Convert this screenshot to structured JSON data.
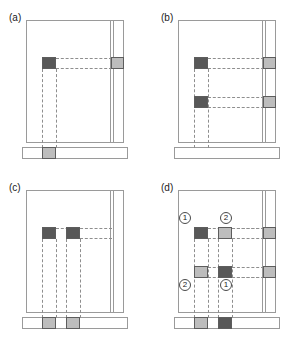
{
  "figure": {
    "colors": {
      "dark_block": "#585858",
      "light_block": "#bdbdbd",
      "outline": "#9a9a9a",
      "dashed_guide": "#8e8e8e",
      "background": "#ffffff"
    },
    "panels": [
      {
        "id": "a",
        "label": "(a)",
        "blocks": [
          {
            "name": "interior-block-1",
            "tone": "dark",
            "x": 42,
            "y": 57,
            "w": 14,
            "h": 12
          },
          {
            "name": "rail-block-1",
            "tone": "light",
            "x": 111,
            "y": 57,
            "w": 13,
            "h": 12
          },
          {
            "name": "bottom-bar-block-1",
            "tone": "light",
            "x": 42,
            "y": 147,
            "w": 14,
            "h": 12
          }
        ],
        "guides": {
          "horizontal": [
            {
              "x": 56,
              "y": 58,
              "w": 56
            },
            {
              "x": 56,
              "y": 68,
              "w": 56
            }
          ],
          "vertical": [
            {
              "x": 42,
              "y": 69,
              "h": 79
            },
            {
              "x": 56,
              "y": 69,
              "h": 79
            }
          ]
        },
        "markers": []
      },
      {
        "id": "b",
        "label": "(b)",
        "blocks": [
          {
            "name": "interior-block-1",
            "tone": "dark",
            "x": 42,
            "y": 57,
            "w": 14,
            "h": 12
          },
          {
            "name": "interior-block-2",
            "tone": "dark",
            "x": 42,
            "y": 96,
            "w": 14,
            "h": 12
          },
          {
            "name": "rail-block-1",
            "tone": "light",
            "x": 111,
            "y": 57,
            "w": 13,
            "h": 12
          },
          {
            "name": "rail-block-2",
            "tone": "light",
            "x": 111,
            "y": 96,
            "w": 13,
            "h": 12
          }
        ],
        "guides": {
          "horizontal": [
            {
              "x": 56,
              "y": 58,
              "w": 56
            },
            {
              "x": 56,
              "y": 68,
              "w": 56
            },
            {
              "x": 56,
              "y": 97,
              "w": 56
            },
            {
              "x": 56,
              "y": 107,
              "w": 56
            }
          ],
          "vertical": [
            {
              "x": 42,
              "y": 69,
              "h": 79
            },
            {
              "x": 56,
              "y": 69,
              "h": 79
            }
          ]
        },
        "markers": []
      },
      {
        "id": "c",
        "label": "(c)",
        "blocks": [
          {
            "name": "interior-block-1",
            "tone": "dark",
            "x": 42,
            "y": 57,
            "w": 14,
            "h": 12
          },
          {
            "name": "interior-block-2",
            "tone": "dark",
            "x": 66,
            "y": 57,
            "w": 14,
            "h": 12
          },
          {
            "name": "bottom-bar-block-1",
            "tone": "light",
            "x": 42,
            "y": 147,
            "w": 14,
            "h": 12
          },
          {
            "name": "bottom-bar-block-2",
            "tone": "light",
            "x": 66,
            "y": 147,
            "w": 14,
            "h": 12
          }
        ],
        "guides": {
          "horizontal": [
            {
              "x": 56,
              "y": 58,
              "w": 56
            },
            {
              "x": 80,
              "y": 68,
              "w": 32
            }
          ],
          "vertical": [
            {
              "x": 42,
              "y": 69,
              "h": 79
            },
            {
              "x": 56,
              "y": 69,
              "h": 79
            },
            {
              "x": 66,
              "y": 69,
              "h": 79
            },
            {
              "x": 80,
              "y": 69,
              "h": 79
            }
          ]
        },
        "markers": []
      },
      {
        "id": "d",
        "label": "(d)",
        "blocks": [
          {
            "name": "interior-block-1",
            "tone": "dark",
            "x": 42,
            "y": 57,
            "w": 14,
            "h": 12
          },
          {
            "name": "interior-block-2",
            "tone": "light",
            "x": 66,
            "y": 57,
            "w": 14,
            "h": 12
          },
          {
            "name": "interior-block-3",
            "tone": "light",
            "x": 42,
            "y": 96,
            "w": 14,
            "h": 12
          },
          {
            "name": "interior-block-4",
            "tone": "dark",
            "x": 66,
            "y": 96,
            "w": 14,
            "h": 12
          },
          {
            "name": "rail-block-1",
            "tone": "light",
            "x": 111,
            "y": 57,
            "w": 13,
            "h": 12
          },
          {
            "name": "rail-block-2",
            "tone": "light",
            "x": 111,
            "y": 96,
            "w": 13,
            "h": 12
          },
          {
            "name": "bottom-bar-block-1",
            "tone": "light",
            "x": 42,
            "y": 147,
            "w": 14,
            "h": 12
          },
          {
            "name": "bottom-bar-block-2",
            "tone": "dark",
            "x": 66,
            "y": 147,
            "w": 14,
            "h": 12
          }
        ],
        "guides": {
          "horizontal": [
            {
              "x": 56,
              "y": 58,
              "w": 56
            },
            {
              "x": 56,
              "y": 68,
              "w": 56
            },
            {
              "x": 80,
              "y": 58,
              "w": 32
            },
            {
              "x": 56,
              "y": 97,
              "w": 56
            },
            {
              "x": 56,
              "y": 107,
              "w": 56
            },
            {
              "x": 80,
              "y": 107,
              "w": 32
            }
          ],
          "vertical": [
            {
              "x": 42,
              "y": 69,
              "h": 79
            },
            {
              "x": 56,
              "y": 69,
              "h": 79
            },
            {
              "x": 66,
              "y": 69,
              "h": 79
            },
            {
              "x": 80,
              "y": 69,
              "h": 79
            }
          ]
        },
        "markers": [
          {
            "name": "marker-top-left",
            "text": "1",
            "x": 27,
            "y": 42
          },
          {
            "name": "marker-top-right",
            "text": "2",
            "x": 68,
            "y": 42
          },
          {
            "name": "marker-bottom-left",
            "text": "2",
            "x": 27,
            "y": 109
          },
          {
            "name": "marker-bottom-right",
            "text": "1",
            "x": 68,
            "y": 109
          }
        ]
      }
    ]
  }
}
